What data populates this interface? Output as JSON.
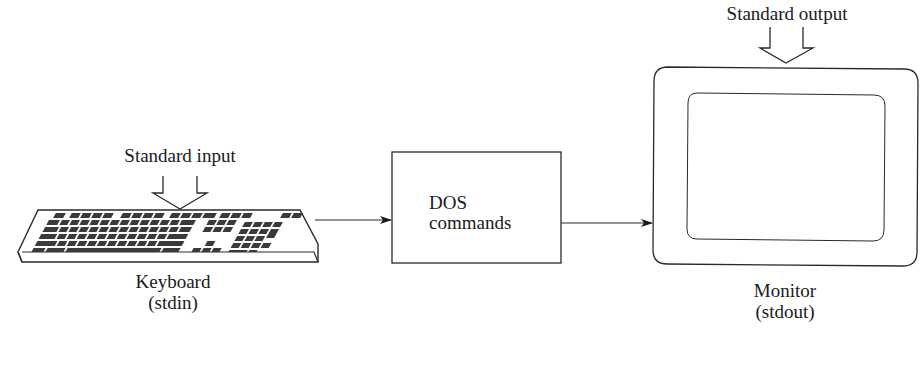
{
  "diagram": {
    "keyboard": {
      "arrow_label": "Standard input",
      "name": "Keyboard",
      "stream": "(stdin)"
    },
    "processor": {
      "line1": "DOS",
      "line2": "commands"
    },
    "monitor": {
      "arrow_label": "Standard output",
      "name": "Monitor",
      "stream": "(stdout)"
    },
    "colors": {
      "stroke": "#2a2a2a",
      "key_fill": "#3a3a3a",
      "background": "#ffffff"
    }
  }
}
